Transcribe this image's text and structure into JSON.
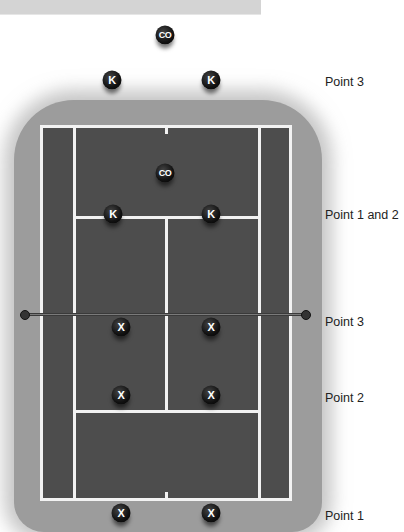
{
  "diagram": {
    "type": "tennis-court-positioning",
    "colors": {
      "court": "#4d4d4d",
      "lines": "#f2f2f2",
      "surround": "#9c9c9c",
      "marker": "#111111",
      "marker_text": "#ffffff",
      "top_bar": "#d4d4d4"
    },
    "markers": [
      {
        "id": "co-outside",
        "text": "CO",
        "x": 165,
        "y": 35
      },
      {
        "id": "k-outside-left",
        "text": "K",
        "x": 112,
        "y": 80
      },
      {
        "id": "k-outside-right",
        "text": "K",
        "x": 211,
        "y": 80
      },
      {
        "id": "co-inside",
        "text": "CO",
        "x": 165,
        "y": 173
      },
      {
        "id": "k-service-left",
        "text": "K",
        "x": 113,
        "y": 214
      },
      {
        "id": "k-service-right",
        "text": "K",
        "x": 211,
        "y": 214
      },
      {
        "id": "x-net-left",
        "text": "X",
        "x": 121,
        "y": 327
      },
      {
        "id": "x-net-right",
        "text": "X",
        "x": 211,
        "y": 327
      },
      {
        "id": "x-service-left",
        "text": "X",
        "x": 121,
        "y": 395
      },
      {
        "id": "x-service-right",
        "text": "X",
        "x": 211,
        "y": 395
      },
      {
        "id": "x-baseline-left",
        "text": "X",
        "x": 121,
        "y": 513
      },
      {
        "id": "x-baseline-right",
        "text": "X",
        "x": 211,
        "y": 513
      }
    ],
    "labels": [
      {
        "text": "Point 3",
        "y": 82
      },
      {
        "text": "Point 1 and 2",
        "y": 215
      },
      {
        "text": "Point 3",
        "y": 322
      },
      {
        "text": "Point 2",
        "y": 398
      },
      {
        "text": "Point 1",
        "y": 516
      }
    ]
  }
}
